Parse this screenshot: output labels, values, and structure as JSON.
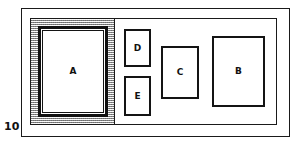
{
  "figure": {
    "number_label": "10",
    "background_color": "#ffffff",
    "line_color": "#1a1a1a",
    "shade_color": "#bdbdbd"
  },
  "outer_container": {
    "name": "outer-boundary"
  },
  "inner_container": {
    "name": "inner-boundary"
  },
  "shaded_region": {
    "name": "hatched-area",
    "fill": "#bdbdbd"
  },
  "boxes": [
    {
      "id": "a",
      "label": "A",
      "framed": true
    },
    {
      "id": "b",
      "label": "B",
      "framed": false
    },
    {
      "id": "c",
      "label": "C",
      "framed": false
    },
    {
      "id": "d",
      "label": "D",
      "framed": false
    },
    {
      "id": "e",
      "label": "E",
      "framed": false
    }
  ]
}
